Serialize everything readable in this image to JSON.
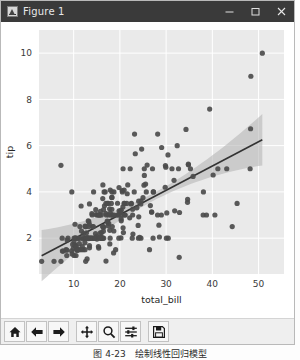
{
  "window": {
    "title": "Figure 1",
    "icon": "matplotlib-icon",
    "buttons": {
      "minimize": "–",
      "maximize": "□",
      "close": "✕"
    }
  },
  "toolbar": {
    "items": [
      {
        "name": "home-icon",
        "tooltip": "Home"
      },
      {
        "name": "back-arrow-icon",
        "tooltip": "Back"
      },
      {
        "name": "forward-arrow-icon",
        "tooltip": "Forward"
      },
      {
        "name": "pan-move-icon",
        "tooltip": "Pan"
      },
      {
        "name": "zoom-magnifier-icon",
        "tooltip": "Zoom"
      },
      {
        "name": "configure-subplots-icon",
        "tooltip": "Configure subplots"
      },
      {
        "name": "save-floppy-icon",
        "tooltip": "Save"
      }
    ]
  },
  "caption": "图 4-23　绘制线性回归模型",
  "colors": {
    "axes_background": "#eaeaea",
    "grid": "#ffffff",
    "point": "#4c4c4c",
    "regression_line": "#333333",
    "confidence_band": "#b0b0b0",
    "titlebar": "#3a3a3a",
    "figure_background": "#ffffff"
  },
  "chart_data": {
    "type": "scatter",
    "title": "",
    "xlabel": "total_bill",
    "ylabel": "tip",
    "xlim": [
      2.5,
      55.5
    ],
    "ylim": [
      0.45,
      11.0
    ],
    "xticks": [
      10,
      20,
      30,
      40,
      50
    ],
    "yticks": [
      2,
      4,
      6,
      8,
      10
    ],
    "grid": true,
    "legend": "none",
    "regression": {
      "shown": true,
      "intercept": 0.92,
      "slope": 0.105,
      "ci": 95,
      "x_start": 3.07,
      "x_end": 50.81
    },
    "points": [
      [
        16.99,
        1.01
      ],
      [
        10.34,
        1.66
      ],
      [
        21.01,
        3.5
      ],
      [
        23.68,
        3.31
      ],
      [
        24.59,
        3.61
      ],
      [
        25.29,
        4.71
      ],
      [
        8.77,
        2.0
      ],
      [
        26.88,
        3.12
      ],
      [
        15.04,
        1.96
      ],
      [
        14.78,
        3.23
      ],
      [
        10.27,
        1.71
      ],
      [
        35.26,
        5.0
      ],
      [
        15.42,
        1.57
      ],
      [
        18.43,
        3.0
      ],
      [
        14.83,
        3.02
      ],
      [
        21.58,
        3.92
      ],
      [
        10.33,
        1.67
      ],
      [
        16.29,
        3.71
      ],
      [
        16.97,
        3.5
      ],
      [
        20.65,
        3.35
      ],
      [
        17.92,
        4.08
      ],
      [
        20.29,
        2.75
      ],
      [
        15.77,
        2.23
      ],
      [
        39.42,
        7.58
      ],
      [
        19.82,
        3.18
      ],
      [
        17.81,
        2.34
      ],
      [
        13.37,
        2.0
      ],
      [
        12.69,
        2.0
      ],
      [
        21.7,
        4.3
      ],
      [
        19.65,
        3.0
      ],
      [
        9.55,
        1.45
      ],
      [
        18.35,
        2.5
      ],
      [
        15.06,
        3.0
      ],
      [
        20.69,
        2.45
      ],
      [
        17.78,
        3.27
      ],
      [
        24.06,
        3.6
      ],
      [
        16.31,
        2.0
      ],
      [
        16.93,
        3.07
      ],
      [
        18.69,
        2.31
      ],
      [
        31.27,
        5.0
      ],
      [
        16.04,
        2.24
      ],
      [
        17.46,
        2.54
      ],
      [
        13.94,
        3.06
      ],
      [
        9.68,
        1.32
      ],
      [
        30.4,
        5.6
      ],
      [
        18.29,
        3.0
      ],
      [
        22.23,
        5.0
      ],
      [
        32.4,
        6.0
      ],
      [
        28.55,
        2.05
      ],
      [
        18.04,
        3.0
      ],
      [
        12.54,
        2.5
      ],
      [
        10.29,
        2.6
      ],
      [
        34.81,
        5.2
      ],
      [
        9.94,
        1.56
      ],
      [
        25.56,
        4.34
      ],
      [
        19.49,
        3.51
      ],
      [
        38.01,
        3.0
      ],
      [
        26.41,
        1.5
      ],
      [
        11.24,
        1.76
      ],
      [
        48.27,
        6.73
      ],
      [
        20.29,
        3.21
      ],
      [
        13.81,
        2.0
      ],
      [
        11.02,
        1.98
      ],
      [
        18.29,
        3.76
      ],
      [
        17.59,
        2.64
      ],
      [
        20.08,
        3.15
      ],
      [
        16.45,
        2.47
      ],
      [
        3.07,
        1.0
      ],
      [
        20.23,
        2.01
      ],
      [
        15.01,
        2.09
      ],
      [
        12.02,
        1.97
      ],
      [
        17.07,
        3.0
      ],
      [
        26.86,
        3.14
      ],
      [
        25.28,
        5.0
      ],
      [
        14.73,
        2.2
      ],
      [
        10.51,
        1.25
      ],
      [
        17.92,
        3.08
      ],
      [
        27.2,
        4.0
      ],
      [
        22.76,
        3.0
      ],
      [
        17.29,
        2.71
      ],
      [
        19.44,
        3.0
      ],
      [
        16.66,
        3.4
      ],
      [
        10.07,
        1.83
      ],
      [
        32.68,
        5.0
      ],
      [
        15.98,
        2.03
      ],
      [
        34.83,
        5.17
      ],
      [
        13.03,
        2.0
      ],
      [
        18.28,
        4.0
      ],
      [
        24.71,
        5.85
      ],
      [
        21.16,
        3.0
      ],
      [
        28.97,
        3.0
      ],
      [
        22.49,
        3.5
      ],
      [
        5.75,
        1.0
      ],
      [
        16.32,
        4.3
      ],
      [
        22.75,
        3.25
      ],
      [
        40.17,
        4.73
      ],
      [
        27.28,
        4.0
      ],
      [
        12.03,
        1.5
      ],
      [
        21.01,
        3.0
      ],
      [
        12.46,
        1.5
      ],
      [
        11.35,
        2.5
      ],
      [
        15.38,
        3.0
      ],
      [
        44.3,
        2.5
      ],
      [
        22.42,
        3.48
      ],
      [
        20.92,
        4.08
      ],
      [
        15.36,
        1.64
      ],
      [
        20.49,
        4.06
      ],
      [
        25.21,
        4.29
      ],
      [
        18.24,
        3.76
      ],
      [
        14.31,
        4.0
      ],
      [
        14.0,
        3.0
      ],
      [
        7.25,
        1.0
      ],
      [
        38.07,
        4.0
      ],
      [
        23.95,
        2.55
      ],
      [
        25.71,
        4.0
      ],
      [
        17.31,
        3.5
      ],
      [
        29.93,
        5.07
      ],
      [
        10.65,
        1.5
      ],
      [
        12.43,
        1.8
      ],
      [
        24.08,
        2.92
      ],
      [
        11.69,
        2.31
      ],
      [
        13.42,
        1.68
      ],
      [
        14.26,
        2.5
      ],
      [
        15.95,
        2.0
      ],
      [
        12.48,
        2.52
      ],
      [
        29.8,
        4.2
      ],
      [
        8.52,
        1.48
      ],
      [
        14.52,
        2.0
      ],
      [
        11.38,
        2.0
      ],
      [
        22.82,
        2.18
      ],
      [
        19.08,
        1.5
      ],
      [
        20.27,
        2.83
      ],
      [
        11.17,
        1.5
      ],
      [
        12.26,
        2.0
      ],
      [
        18.26,
        3.25
      ],
      [
        8.51,
        1.25
      ],
      [
        10.33,
        2.0
      ],
      [
        14.15,
        2.0
      ],
      [
        16.0,
        2.0
      ],
      [
        13.16,
        2.75
      ],
      [
        17.47,
        3.5
      ],
      [
        34.3,
        6.7
      ],
      [
        41.19,
        5.0
      ],
      [
        27.05,
        5.0
      ],
      [
        16.43,
        2.3
      ],
      [
        8.35,
        1.5
      ],
      [
        18.64,
        1.36
      ],
      [
        11.87,
        1.63
      ],
      [
        9.78,
        1.73
      ],
      [
        7.51,
        2.0
      ],
      [
        14.07,
        2.5
      ],
      [
        13.13,
        2.0
      ],
      [
        17.26,
        2.74
      ],
      [
        24.55,
        2.0
      ],
      [
        19.77,
        2.0
      ],
      [
        29.85,
        5.14
      ],
      [
        48.17,
        5.0
      ],
      [
        25.0,
        3.75
      ],
      [
        13.39,
        2.61
      ],
      [
        16.49,
        2.0
      ],
      [
        21.5,
        3.5
      ],
      [
        12.66,
        2.5
      ],
      [
        16.21,
        2.0
      ],
      [
        13.81,
        2.0
      ],
      [
        17.51,
        3.0
      ],
      [
        24.52,
        3.48
      ],
      [
        20.76,
        2.24
      ],
      [
        31.71,
        4.5
      ],
      [
        10.59,
        1.61
      ],
      [
        10.63,
        2.0
      ],
      [
        50.81,
        10.0
      ],
      [
        15.81,
        3.16
      ],
      [
        7.25,
        5.15
      ],
      [
        31.85,
        3.18
      ],
      [
        16.82,
        4.0
      ],
      [
        32.9,
        3.11
      ],
      [
        17.89,
        2.0
      ],
      [
        14.48,
        2.0
      ],
      [
        9.6,
        4.0
      ],
      [
        34.63,
        3.55
      ],
      [
        34.65,
        3.68
      ],
      [
        23.33,
        5.65
      ],
      [
        45.35,
        3.5
      ],
      [
        23.17,
        6.5
      ],
      [
        40.55,
        3.0
      ],
      [
        20.69,
        5.0
      ],
      [
        20.9,
        3.5
      ],
      [
        30.46,
        2.0
      ],
      [
        18.15,
        3.5
      ],
      [
        23.1,
        4.0
      ],
      [
        15.69,
        3.0
      ],
      [
        19.81,
        4.19
      ],
      [
        28.44,
        2.56
      ],
      [
        15.48,
        2.02
      ],
      [
        16.58,
        4.0
      ],
      [
        7.56,
        1.44
      ],
      [
        10.34,
        2.0
      ],
      [
        43.11,
        5.0
      ],
      [
        13.0,
        2.0
      ],
      [
        13.51,
        2.0
      ],
      [
        18.71,
        4.0
      ],
      [
        12.74,
        2.01
      ],
      [
        13.0,
        2.0
      ],
      [
        16.4,
        2.5
      ],
      [
        20.53,
        4.0
      ],
      [
        16.47,
        3.23
      ],
      [
        26.59,
        3.41
      ],
      [
        38.73,
        3.0
      ],
      [
        24.27,
        2.03
      ],
      [
        12.76,
        2.23
      ],
      [
        30.06,
        2.0
      ],
      [
        25.89,
        5.16
      ],
      [
        48.33,
        9.0
      ],
      [
        13.27,
        2.5
      ],
      [
        28.17,
        6.5
      ],
      [
        12.9,
        1.1
      ],
      [
        28.15,
        3.0
      ],
      [
        11.59,
        1.5
      ],
      [
        7.74,
        1.44
      ],
      [
        30.14,
        3.09
      ],
      [
        12.16,
        2.2
      ],
      [
        13.42,
        3.48
      ],
      [
        8.58,
        1.92
      ],
      [
        15.98,
        3.0
      ],
      [
        13.42,
        1.58
      ],
      [
        16.27,
        2.5
      ],
      [
        10.09,
        2.0
      ],
      [
        20.45,
        3.0
      ],
      [
        13.28,
        2.72
      ],
      [
        22.12,
        2.88
      ],
      [
        24.01,
        2.0
      ],
      [
        15.69,
        2.0
      ],
      [
        11.61,
        3.39
      ],
      [
        10.77,
        1.47
      ],
      [
        15.53,
        3.0
      ],
      [
        10.07,
        1.25
      ],
      [
        12.6,
        1.0
      ],
      [
        32.83,
        1.17
      ],
      [
        35.83,
        4.67
      ],
      [
        29.03,
        5.92
      ],
      [
        27.18,
        2.0
      ],
      [
        22.67,
        2.0
      ],
      [
        17.82,
        1.75
      ],
      [
        18.78,
        3.0
      ]
    ]
  }
}
